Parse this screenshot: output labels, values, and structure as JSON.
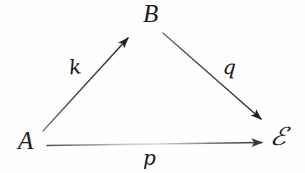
{
  "diagram": {
    "type": "commutative-triangle",
    "style": "handwritten-scan",
    "background_color": "#fefefe",
    "ink_color": "#1d1d1d",
    "nodes": [
      {
        "id": "a",
        "label": "A",
        "x": 30,
        "y": 140
      },
      {
        "id": "b",
        "label": "B",
        "x": 155,
        "y": 14
      },
      {
        "id": "x",
        "label": "ℰ",
        "x": 281,
        "y": 138
      }
    ],
    "edges": [
      {
        "id": "k",
        "label": "k",
        "from": "a",
        "to": "b",
        "arrowhead": "filled-solid",
        "label_x": 75,
        "label_y": 68
      },
      {
        "id": "q",
        "label": "q",
        "from": "b",
        "to": "x",
        "arrowhead": "filled-solid",
        "label_x": 229,
        "label_y": 68
      },
      {
        "id": "p",
        "label": "p",
        "from": "a",
        "to": "x",
        "arrowhead": "filled-solid",
        "label_x": 152,
        "label_y": 158
      }
    ]
  }
}
